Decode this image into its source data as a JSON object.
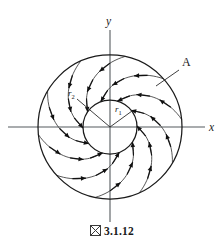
{
  "figure": {
    "caption_marker": "figure-box-glyph",
    "caption_number": "3.1.12",
    "caption_full": "図 3.1.12"
  },
  "axes": {
    "x_label": "x",
    "y_label": "y",
    "x_line": {
      "x1": 8,
      "y1": 127,
      "x2": 205,
      "y2": 127
    },
    "y_line": {
      "x1": 110,
      "y1": 30,
      "x2": 110,
      "y2": 222
    },
    "x_label_pos": {
      "x": 209,
      "y": 131
    },
    "y_label_pos": {
      "x": 106,
      "y": 25
    }
  },
  "annotations": {
    "region_label": "A",
    "region_label_pos": {
      "x": 182,
      "y": 66
    },
    "leader": {
      "x1": 179,
      "y1": 70,
      "x2": 156,
      "y2": 86
    },
    "inner_radius_label": "r",
    "inner_radius_sub": "1",
    "inner_radius_label_pos": {
      "x": 115,
      "y": 112
    },
    "outer_radius_label": "r",
    "outer_radius_sub": "2",
    "outer_radius_label_pos": {
      "x": 68,
      "y": 96
    }
  },
  "geometry": {
    "center": {
      "x": 110,
      "y": 127
    },
    "inner_radius": 27,
    "outer_radius": 72,
    "inner_radius_line": {
      "x1": 110,
      "y1": 127,
      "x2": 132,
      "y2": 111
    },
    "outer_radius_line": {
      "x1": 110,
      "y1": 127,
      "x2": 77,
      "y2": 99
    }
  },
  "chart_data": {
    "type": "vector-field-diagram",
    "xlabel": "x",
    "ylabel": "y",
    "circles": [
      {
        "name": "inner-circle",
        "radius_label": "r1",
        "radius_px": 27
      },
      {
        "name": "outer-circle",
        "radius_label": "r2",
        "radius_px": 72
      }
    ],
    "field_direction": "counterclockwise",
    "spiral_count": 10,
    "arrows_per_spiral": 3,
    "legend": [
      "A"
    ],
    "grid": false
  }
}
